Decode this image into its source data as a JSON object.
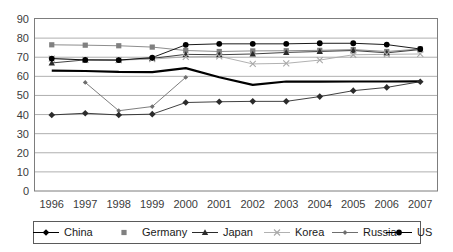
{
  "chart_data": {
    "type": "line",
    "title": "",
    "subtitle": "",
    "xlabel": "",
    "ylabel": "",
    "categories": [
      "1996",
      "1997",
      "1998",
      "1999",
      "2000",
      "2001",
      "2002",
      "2003",
      "2004",
      "2005",
      "2006",
      "2007"
    ],
    "x": [
      1996,
      1997,
      1998,
      1999,
      2000,
      2001,
      2002,
      2003,
      2004,
      2005,
      2006,
      2007
    ],
    "ylim": [
      0,
      90
    ],
    "ytick_step": 10,
    "yticks": [
      "90",
      "80",
      "70",
      "60",
      "50",
      "40",
      "30",
      "20",
      "10",
      "0"
    ],
    "grid": "horizontal",
    "legend_position": "bottom",
    "series": [
      {
        "name": "China",
        "marker": "diamond",
        "color": "#000000",
        "line_width": 2.2,
        "values": [
          63.0,
          62.8,
          62.3,
          62.2,
          64.3,
          59.5,
          55.5,
          57.3,
          57.2,
          57.3,
          57.3,
          57.4
        ]
      },
      {
        "name": "Germany",
        "marker": "square",
        "color": "#808080",
        "line_width": 0.9,
        "values": [
          76.5,
          76.3,
          76.0,
          75.3,
          73.5,
          73.0,
          73.3,
          73.4,
          73.6,
          74.0,
          73.0,
          74.3
        ]
      },
      {
        "name": "Japan",
        "marker": "triangle",
        "color": "#2b2b2b",
        "line_width": 0.9,
        "values": [
          67.0,
          68.6,
          68.5,
          69.4,
          71.5,
          71.3,
          71.7,
          72.5,
          73.0,
          73.5,
          72.3,
          74.0
        ]
      },
      {
        "name": "Korea",
        "marker": "cross",
        "color": "#a8a8a8",
        "line_width": 0.9,
        "values": [
          69.3,
          68.6,
          68.5,
          69.0,
          70.2,
          70.5,
          66.5,
          66.8,
          68.5,
          71.3,
          71.5,
          71.7
        ]
      },
      {
        "name": "Russia",
        "marker": "small-diamond",
        "color": "#6e6e6e",
        "line_width": 0.9,
        "values": [
          null,
          56.8,
          42.0,
          44.2,
          59.5,
          null,
          null,
          null,
          null,
          null,
          null,
          null
        ]
      },
      {
        "name": "US",
        "marker": "circle",
        "color": "#000000",
        "line_width": 0.9,
        "values": [
          69.3,
          68.6,
          68.5,
          69.8,
          76.5,
          77.0,
          77.0,
          77.0,
          77.3,
          77.3,
          76.6,
          74.3
        ]
      },
      {
        "name": "Russia2",
        "marker": "diamond",
        "color": "#2b2b2b",
        "line_width": 0.9,
        "values": [
          39.8,
          40.7,
          39.8,
          40.2,
          46.3,
          46.7,
          46.9,
          46.9,
          49.4,
          52.5,
          54.2,
          57.2
        ]
      }
    ],
    "legend": [
      {
        "label": "China",
        "marker": "diamond",
        "color": "#000000"
      },
      {
        "label": "Germany",
        "marker": "square",
        "color": "#808080"
      },
      {
        "label": "Japan",
        "marker": "triangle",
        "color": "#2b2b2b"
      },
      {
        "label": "Korea",
        "marker": "cross",
        "color": "#a8a8a8"
      },
      {
        "label": "Russia",
        "marker": "small-diamond",
        "color": "#6e6e6e"
      },
      {
        "label": "US",
        "marker": "circle",
        "color": "#000000"
      }
    ]
  },
  "legend_labels": {
    "china": "China",
    "germany": "Germany",
    "japan": "Japan",
    "korea": "Korea",
    "russia": "Russia",
    "us": "US"
  }
}
